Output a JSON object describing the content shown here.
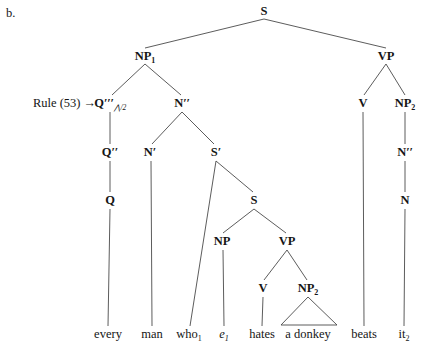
{
  "figure": {
    "item_letter": "b.",
    "annotation": {
      "text": "Rule (53)",
      "arrow": "→",
      "x": 96,
      "y": 103
    },
    "ink_color": "#4a4a4a",
    "text_color": "#151515",
    "width": 425,
    "height": 347
  },
  "tree": {
    "nodes": [
      {
        "id": "S",
        "label": "S",
        "sub": "",
        "prime": "",
        "qsub": "",
        "x": 264,
        "y": 11,
        "type": "nonterminal"
      },
      {
        "id": "NP1",
        "label": "NP",
        "sub": "1",
        "prime": "",
        "qsub": "",
        "x": 145,
        "y": 56,
        "type": "nonterminal"
      },
      {
        "id": "VP_main",
        "label": "VP",
        "sub": "",
        "prime": "",
        "qsub": "",
        "x": 386,
        "y": 56,
        "type": "nonterminal"
      },
      {
        "id": "Q3",
        "label": "Q",
        "sub": "",
        "prime": "′′′",
        "qsub": "⋀/2",
        "x": 110,
        "y": 103,
        "type": "nonterminal"
      },
      {
        "id": "N2",
        "label": "N",
        "sub": "",
        "prime": "′′",
        "qsub": "",
        "x": 182,
        "y": 103,
        "type": "nonterminal"
      },
      {
        "id": "V_main",
        "label": "V",
        "sub": "",
        "prime": "",
        "qsub": "",
        "x": 363,
        "y": 103,
        "type": "nonterminal"
      },
      {
        "id": "NP2_obj",
        "label": "NP",
        "sub": "2",
        "prime": "",
        "qsub": "",
        "x": 405,
        "y": 103,
        "type": "nonterminal"
      },
      {
        "id": "Q2",
        "label": "Q",
        "sub": "",
        "prime": "′′",
        "qsub": "",
        "x": 110,
        "y": 152,
        "type": "nonterminal"
      },
      {
        "id": "N1",
        "label": "N",
        "sub": "",
        "prime": "′",
        "qsub": "",
        "x": 150,
        "y": 152,
        "type": "nonterminal"
      },
      {
        "id": "Sbar",
        "label": "S",
        "sub": "",
        "prime": "′",
        "qsub": "",
        "x": 216,
        "y": 152,
        "type": "nonterminal"
      },
      {
        "id": "N2_obj",
        "label": "N",
        "sub": "",
        "prime": "′′",
        "qsub": "",
        "x": 405,
        "y": 152,
        "type": "nonterminal"
      },
      {
        "id": "Q0",
        "label": "Q",
        "sub": "",
        "prime": "",
        "qsub": "",
        "x": 110,
        "y": 200,
        "type": "nonterminal"
      },
      {
        "id": "S_emb",
        "label": "S",
        "sub": "",
        "prime": "",
        "qsub": "",
        "x": 254,
        "y": 200,
        "type": "nonterminal"
      },
      {
        "id": "N0_obj",
        "label": "N",
        "sub": "",
        "prime": "",
        "qsub": "",
        "x": 405,
        "y": 200,
        "type": "nonterminal"
      },
      {
        "id": "NP_emb",
        "label": "NP",
        "sub": "",
        "prime": "",
        "qsub": "",
        "x": 222,
        "y": 241,
        "type": "nonterminal"
      },
      {
        "id": "VP_emb",
        "label": "VP",
        "sub": "",
        "prime": "",
        "qsub": "",
        "x": 287,
        "y": 241,
        "type": "nonterminal"
      },
      {
        "id": "V_emb",
        "label": "V",
        "sub": "",
        "prime": "",
        "qsub": "",
        "x": 263,
        "y": 288,
        "type": "nonterminal"
      },
      {
        "id": "NP2_emb",
        "label": "NP",
        "sub": "2",
        "prime": "",
        "qsub": "",
        "x": 308,
        "y": 288,
        "type": "nonterminal"
      }
    ],
    "terminals": [
      {
        "id": "t_every",
        "text": "every",
        "sub": "",
        "italic": false,
        "x": 108,
        "y": 334
      },
      {
        "id": "t_man",
        "text": "man",
        "sub": "",
        "italic": false,
        "x": 152,
        "y": 334
      },
      {
        "id": "t_who",
        "text": "who",
        "sub": "1",
        "italic": false,
        "x": 189,
        "y": 334
      },
      {
        "id": "t_e",
        "text": "e",
        "sub": "1",
        "italic": true,
        "x": 224,
        "y": 334
      },
      {
        "id": "t_hates",
        "text": "hates",
        "sub": "",
        "italic": false,
        "x": 262,
        "y": 334
      },
      {
        "id": "t_donkey",
        "text": "a donkey",
        "sub": "",
        "italic": false,
        "x": 308,
        "y": 334
      },
      {
        "id": "t_beats",
        "text": "beats",
        "sub": "",
        "italic": false,
        "x": 364,
        "y": 334
      },
      {
        "id": "t_it",
        "text": "it",
        "sub": "2",
        "italic": false,
        "x": 404,
        "y": 334
      }
    ],
    "edges": [
      {
        "from": "S",
        "to": "NP1",
        "x1": 264,
        "y1": 19,
        "x2": 145,
        "y2": 48
      },
      {
        "from": "S",
        "to": "VP_main",
        "x1": 264,
        "y1": 19,
        "x2": 386,
        "y2": 48
      },
      {
        "from": "NP1",
        "to": "Q3",
        "x1": 145,
        "y1": 64,
        "x2": 112,
        "y2": 95
      },
      {
        "from": "NP1",
        "to": "N2",
        "x1": 145,
        "y1": 64,
        "x2": 181,
        "y2": 95
      },
      {
        "from": "VP_main",
        "to": "V_main",
        "x1": 386,
        "y1": 64,
        "x2": 364,
        "y2": 95
      },
      {
        "from": "VP_main",
        "to": "NP2_obj",
        "x1": 386,
        "y1": 64,
        "x2": 405,
        "y2": 95
      },
      {
        "from": "Q3",
        "to": "Q2",
        "x1": 110,
        "y1": 112,
        "x2": 110,
        "y2": 144
      },
      {
        "from": "N2",
        "to": "N1",
        "x1": 182,
        "y1": 112,
        "x2": 152,
        "y2": 144
      },
      {
        "from": "N2",
        "to": "Sbar",
        "x1": 182,
        "y1": 112,
        "x2": 214,
        "y2": 144
      },
      {
        "from": "NP2_obj",
        "to": "N2_obj",
        "x1": 405,
        "y1": 112,
        "x2": 405,
        "y2": 144
      },
      {
        "from": "Q2",
        "to": "Q0",
        "x1": 110,
        "y1": 161,
        "x2": 110,
        "y2": 192
      },
      {
        "from": "Sbar",
        "to": "t_who",
        "x1": 216,
        "y1": 161,
        "x2": 190,
        "y2": 326
      },
      {
        "from": "Sbar",
        "to": "S_emb",
        "x1": 216,
        "y1": 161,
        "x2": 253,
        "y2": 192
      },
      {
        "from": "N2_obj",
        "to": "N0_obj",
        "x1": 405,
        "y1": 161,
        "x2": 405,
        "y2": 192
      },
      {
        "from": "Q0",
        "to": "t_every",
        "x1": 110,
        "y1": 209,
        "x2": 108,
        "y2": 326
      },
      {
        "from": "N1",
        "to": "t_man",
        "x1": 151,
        "y1": 161,
        "x2": 152,
        "y2": 326
      },
      {
        "from": "S_emb",
        "to": "NP_emb",
        "x1": 254,
        "y1": 209,
        "x2": 223,
        "y2": 233
      },
      {
        "from": "S_emb",
        "to": "VP_emb",
        "x1": 254,
        "y1": 209,
        "x2": 286,
        "y2": 233
      },
      {
        "from": "NP_emb",
        "to": "t_e",
        "x1": 223,
        "y1": 250,
        "x2": 224,
        "y2": 326
      },
      {
        "from": "VP_emb",
        "to": "V_emb",
        "x1": 287,
        "y1": 250,
        "x2": 264,
        "y2": 280
      },
      {
        "from": "VP_emb",
        "to": "NP2_emb",
        "x1": 287,
        "y1": 250,
        "x2": 307,
        "y2": 280
      },
      {
        "from": "V_emb",
        "to": "t_hates",
        "x1": 263,
        "y1": 297,
        "x2": 262,
        "y2": 326
      },
      {
        "from": "V_main",
        "to": "t_beats",
        "x1": 363,
        "y1": 112,
        "x2": 364,
        "y2": 326
      },
      {
        "from": "N0_obj",
        "to": "t_it",
        "x1": 405,
        "y1": 209,
        "x2": 404,
        "y2": 326
      }
    ],
    "triangles": [
      {
        "id": "tri_donkey",
        "over": "a donkey",
        "apex_x": 308,
        "apex_y": 297,
        "left_x": 281,
        "right_x": 337,
        "base_y": 325
      }
    ]
  }
}
